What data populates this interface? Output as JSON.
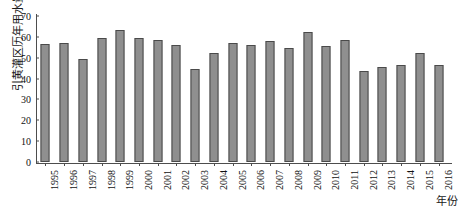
{
  "chart_data": {
    "type": "bar",
    "title": "",
    "xlabel": "年份",
    "ylabel": "引黄灌区历年用水量/亿 m³",
    "ylabel_parts": {
      "text": "引黄灌区历年用水量/亿 ",
      "unit_base": "m",
      "unit_sup": "3"
    },
    "categories": [
      "1995",
      "1996",
      "1997",
      "1998",
      "1999",
      "2000",
      "2001",
      "2002",
      "2003",
      "2004",
      "2005",
      "2006",
      "2007",
      "2008",
      "2009",
      "2010",
      "2011",
      "2012",
      "2013",
      "2014",
      "2015",
      "2016"
    ],
    "values": [
      56.5,
      57.0,
      49.5,
      59.5,
      63.5,
      59.5,
      58.5,
      56.0,
      44.5,
      52.5,
      57.0,
      56.0,
      58.0,
      54.5,
      62.5,
      55.5,
      58.5,
      43.5,
      45.5,
      46.5,
      52.5,
      46.5
    ],
    "ylim": [
      0,
      70
    ],
    "yticks": [
      0,
      10,
      20,
      30,
      40,
      50,
      60,
      70
    ],
    "ytick_labels": [
      "0",
      "10",
      "20",
      "30",
      "40",
      "50",
      "60",
      "70"
    ],
    "grid": false,
    "legend": "none",
    "bar_color": "#8f8f8f",
    "bar_edge_color": "#4a4a4a",
    "axis_color": "#4d4d4d"
  }
}
